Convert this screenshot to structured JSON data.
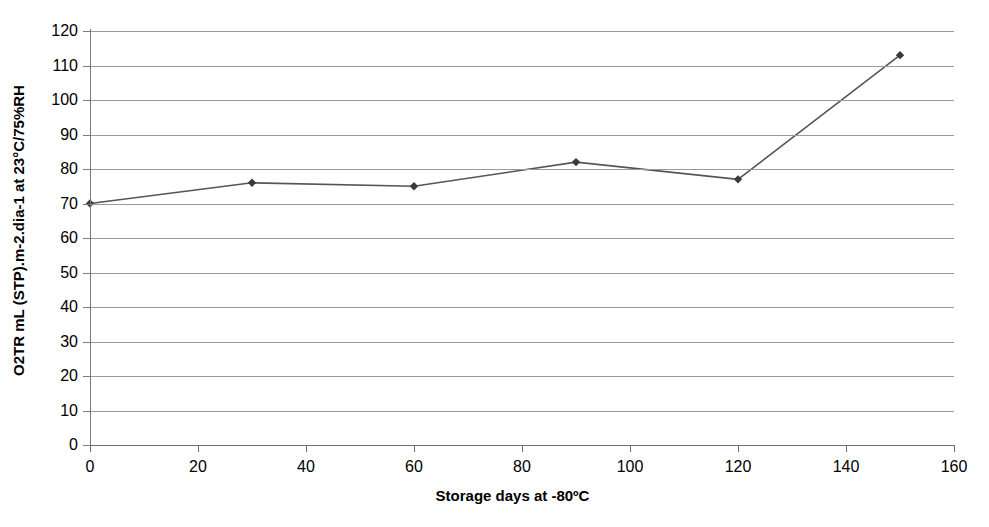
{
  "chart_data": {
    "type": "line",
    "title": "",
    "xlabel": "Storage days at -80ºC",
    "ylabel": "O2TR mL (STP).m-2.dia-1 at 23°C/75%RH",
    "x": [
      0,
      30,
      60,
      90,
      120,
      150
    ],
    "values": [
      70,
      76,
      75,
      82,
      77,
      113
    ],
    "series": [
      {
        "name": "O2TR",
        "x": [
          0,
          30,
          60,
          90,
          120,
          150
        ],
        "values": [
          70,
          76,
          75,
          82,
          77,
          113
        ]
      }
    ],
    "xlim": [
      0,
      160
    ],
    "ylim": [
      0,
      120
    ],
    "xticks": [
      0,
      20,
      40,
      60,
      80,
      100,
      120,
      140,
      160
    ],
    "yticks": [
      0,
      10,
      20,
      30,
      40,
      50,
      60,
      70,
      80,
      90,
      100,
      110,
      120
    ],
    "xtick_labels": [
      "0",
      "20",
      "40",
      "60",
      "80",
      "100",
      "120",
      "140",
      "160"
    ],
    "ytick_labels": [
      "0",
      "10",
      "20",
      "30",
      "40",
      "50",
      "60",
      "70",
      "80",
      "90",
      "100",
      "110",
      "120"
    ],
    "grid": "horizontal",
    "legend": "none",
    "marker": "diamond",
    "line_color": "#555555",
    "marker_color": "#3a3a3a",
    "grid_color": "#9a9a9a",
    "background": "#ffffff"
  }
}
